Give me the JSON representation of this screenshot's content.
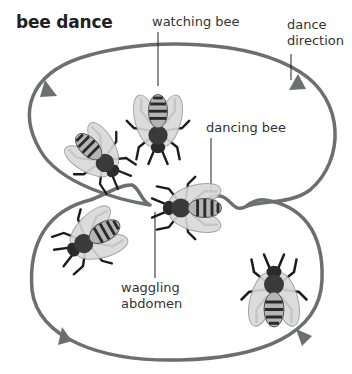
{
  "title": "bee dance",
  "labels": {
    "watching_bee": "watching bee",
    "dance_direction_line1": "dance",
    "dance_direction_line2": "direction",
    "dancing_bee": "dancing bee",
    "waggling_abdomen_line1": "waggling",
    "waggling_abdomen_line2": "abdomen"
  },
  "colors": {
    "path": "#6d6e70",
    "leader": "#231f20",
    "text": "#231f20"
  }
}
